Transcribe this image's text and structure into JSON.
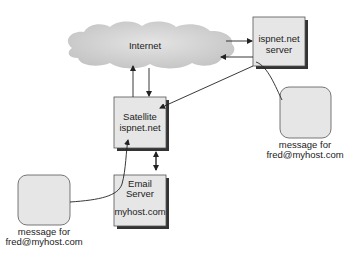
{
  "diagram": {
    "cloud": {
      "label": "Internet"
    },
    "isp_server": {
      "line1": "ispnet.net",
      "line2": "server"
    },
    "satellite": {
      "line1": "Satellite",
      "line2": "ispnet.net"
    },
    "email_server": {
      "line1": "Email",
      "line2": "Server",
      "line3": "myhost.com"
    },
    "message_right": {
      "line1": "message for",
      "line2": "fred@myhost.com"
    },
    "message_left": {
      "line1": "message for",
      "line2": "fred@myhost.com"
    },
    "colors": {
      "box_fill": "#e6e6e6",
      "box_border": "#555555",
      "shadow": "#333333",
      "cloud": "#cfcfcf",
      "line": "#222222"
    }
  }
}
